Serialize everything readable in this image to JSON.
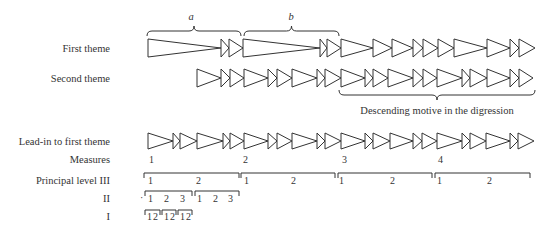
{
  "rows": {
    "first_theme": {
      "label": "First theme",
      "y_mid": 48,
      "half_h": 9,
      "bounds": [
        148,
        221,
        229,
        243,
        320,
        327,
        341,
        373,
        392,
        413,
        423,
        438,
        454,
        487,
        510,
        519,
        535
      ]
    },
    "second_theme": {
      "label": "Second theme",
      "y_mid": 78,
      "half_h": 9,
      "bounds": [
        197,
        221,
        230,
        244,
        268,
        277,
        292,
        317,
        325,
        341,
        365,
        373,
        388,
        413,
        423,
        437,
        462,
        470,
        487,
        510,
        519,
        533
      ]
    },
    "lead_in": {
      "label": "Lead-in to first theme",
      "y_mid": 141,
      "half_h": 8,
      "bounds": [
        148,
        173,
        180,
        197,
        223,
        230,
        244,
        268,
        277,
        292,
        317,
        325,
        341,
        365,
        373,
        390,
        413,
        422,
        437,
        462,
        470,
        486,
        510,
        518,
        534
      ]
    }
  },
  "top_braces": [
    {
      "label": "a",
      "x1": 147,
      "x2": 241
    },
    {
      "label": "b",
      "x1": 244,
      "x2": 339
    }
  ],
  "digression_brace": {
    "label": "Descending motive in the digression",
    "x1": 339,
    "x2": 535
  },
  "measures": {
    "label": "Measures",
    "items": [
      {
        "n": "1",
        "x": 149
      },
      {
        "n": "2",
        "x": 243
      },
      {
        "n": "3",
        "x": 342
      },
      {
        "n": "4",
        "x": 438
      }
    ]
  },
  "levels": {
    "III": {
      "label": "Principal level  III",
      "spans": [
        {
          "x1": 144,
          "x2": 239,
          "beats": [
            {
              "t": "1",
              "x": 148
            },
            {
              "t": "2",
              "x": 196
            }
          ]
        },
        {
          "x1": 241,
          "x2": 335,
          "beats": [
            {
              "t": "1",
              "x": 244
            },
            {
              "t": "2",
              "x": 291
            }
          ]
        },
        {
          "x1": 338,
          "x2": 432,
          "beats": [
            {
              "t": "1",
              "x": 339
            },
            {
              "t": "2",
              "x": 390
            }
          ]
        },
        {
          "x1": 435,
          "x2": 530,
          "beats": [
            {
              "t": "1",
              "x": 437
            },
            {
              "t": "2",
              "x": 487
            }
          ]
        }
      ]
    },
    "II": {
      "label": "II",
      "prefix_dot": "·",
      "spans": [
        {
          "x1": 145,
          "x2": 192,
          "beats": [
            {
              "t": "1",
              "x": 148
            },
            {
              "t": "2",
              "x": 164
            },
            {
              "t": "3",
              "x": 180
            }
          ]
        },
        {
          "x1": 195,
          "x2": 239,
          "beats": [
            {
              "t": "1",
              "x": 197
            },
            {
              "t": "2",
              "x": 213
            },
            {
              "t": "3",
              "x": 228
            }
          ]
        }
      ]
    },
    "I": {
      "label": "I",
      "spans": [
        {
          "x1": 145,
          "x2": 160,
          "beats": [
            {
              "t": "1",
              "x": 147
            },
            {
              "t": "2",
              "x": 153
            }
          ]
        },
        {
          "x1": 162,
          "x2": 176,
          "beats": [
            {
              "t": "1",
              "x": 164
            },
            {
              "t": "2",
              "x": 170
            }
          ]
        },
        {
          "x1": 178,
          "x2": 192,
          "beats": [
            {
              "t": "1",
              "x": 180
            },
            {
              "t": "2",
              "x": 186
            }
          ]
        }
      ]
    }
  }
}
